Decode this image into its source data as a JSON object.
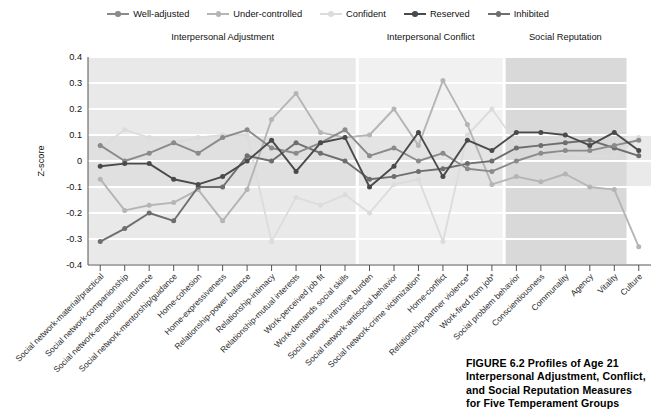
{
  "figure": {
    "caption_lines": [
      "FIGURE 6.2  Profiles of Age 21",
      "Interpersonal Adjustment, Conflict,",
      "and Social Reputation Measures",
      "for Five Temperament Groups"
    ]
  },
  "legend": {
    "position": "top-center",
    "items": [
      {
        "label": "Well-adjusted",
        "color": "#8a8a8a"
      },
      {
        "label": "Under-controlled",
        "color": "#b5b5b5"
      },
      {
        "label": "Confident",
        "color": "#dcdcdc"
      },
      {
        "label": "Reserved",
        "color": "#4a4a4a"
      },
      {
        "label": "Inhibited",
        "color": "#6e6e6e"
      }
    ]
  },
  "panels": [
    {
      "title": "Interpersonal Adjustment",
      "count": 11,
      "band": "#e9e9e9"
    },
    {
      "title": "Interpersonal Conflict",
      "count": 6,
      "band": "#f1f1f1"
    },
    {
      "title": "Social Reputation",
      "count": 5,
      "band": "#d9d9d9"
    }
  ],
  "chart_data": {
    "type": "line",
    "title": "",
    "xlabel": "",
    "ylabel": "Z-score",
    "ylim": [
      -0.4,
      0.4
    ],
    "yticks": [
      0.4,
      0.3,
      0.2,
      0.1,
      0,
      -0.1,
      -0.2,
      -0.3,
      -0.4
    ],
    "ytick_labels": [
      "0.4",
      "0.3",
      "0.2",
      "0.1",
      "0",
      "-0.1",
      "-0.2",
      "-0.3",
      "-0.4"
    ],
    "grid": true,
    "categories": [
      "Social network-material/practical",
      "Social network-companionship",
      "Social network-emotional/nurturance",
      "Social network-mentorship/guidance",
      "Home-cohesion",
      "Home-expressiveness",
      "Relationship-power balance",
      "Relationship-intimacy",
      "Relationship-mutual interests",
      "Work-perceived job fit",
      "Work-demands social skills",
      "Social network-intrusive burden",
      "Social network-antisocial behavior",
      "Social network-crime victimization*",
      "Home-conflict",
      "Relationship-partner violence*",
      "Work-fired from job*",
      "Social problem behavior",
      "Conscientiousness",
      "Communality",
      "Agency",
      "Vitality",
      "Culture"
    ],
    "series": [
      {
        "name": "Well-adjusted",
        "color": "#8a8a8a",
        "values": [
          0.06,
          0.0,
          0.03,
          0.07,
          0.03,
          0.09,
          0.12,
          0.05,
          0.03,
          0.07,
          0.12,
          0.02,
          0.05,
          0.0,
          0.03,
          -0.03,
          -0.04,
          0.0,
          0.03,
          0.04,
          0.04,
          0.06,
          0.08
        ]
      },
      {
        "name": "Under-controlled",
        "color": "#b5b5b5",
        "values": [
          -0.07,
          -0.19,
          -0.17,
          -0.16,
          -0.11,
          -0.23,
          -0.11,
          0.16,
          0.26,
          0.11,
          0.09,
          0.1,
          0.2,
          0.06,
          0.31,
          0.14,
          -0.09,
          -0.06,
          -0.08,
          -0.05,
          -0.1,
          -0.11,
          -0.33
        ]
      },
      {
        "name": "Confident",
        "color": "#dcdcdc",
        "values": [
          0.05,
          0.12,
          0.09,
          0.07,
          0.09,
          0.1,
          0.1,
          -0.31,
          -0.14,
          -0.17,
          -0.13,
          -0.2,
          -0.09,
          -0.07,
          -0.31,
          0.1,
          0.2,
          0.07,
          0.04,
          0.03,
          0.02,
          0.02,
          0.09
        ]
      },
      {
        "name": "Reserved",
        "color": "#4a4a4a",
        "values": [
          -0.02,
          -0.01,
          -0.01,
          -0.07,
          -0.09,
          -0.06,
          0.0,
          0.08,
          -0.04,
          0.07,
          0.09,
          -0.1,
          -0.02,
          0.11,
          -0.06,
          0.08,
          0.04,
          0.11,
          0.11,
          0.1,
          0.06,
          0.11,
          0.04
        ]
      },
      {
        "name": "Inhibited",
        "color": "#6e6e6e",
        "values": [
          -0.31,
          -0.26,
          -0.2,
          -0.23,
          -0.1,
          -0.1,
          0.02,
          0.0,
          0.07,
          0.03,
          0.0,
          -0.07,
          -0.06,
          -0.04,
          -0.03,
          -0.01,
          0.0,
          0.05,
          0.06,
          0.07,
          0.08,
          0.05,
          0.02
        ]
      }
    ],
    "shade_band": {
      "from": -0.1,
      "to": 0.1,
      "color": "#d8d8d8"
    }
  }
}
